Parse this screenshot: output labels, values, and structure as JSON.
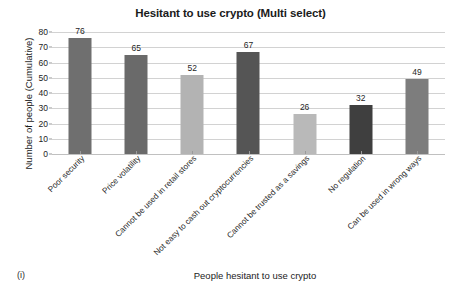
{
  "figure": {
    "marker": "(i)"
  },
  "chart_data": {
    "type": "bar",
    "title": "Hesitant to use crypto (Multi select)",
    "xlabel": "People hesitant to use crypto",
    "ylabel": "Number of people (Cumulative)",
    "ylim": [
      0,
      80
    ],
    "ytick_step": 10,
    "yticks": [
      "0",
      "10",
      "20",
      "30",
      "40",
      "50",
      "60",
      "70",
      "80"
    ],
    "grid": true,
    "legend": "none",
    "categories": [
      "Poor security",
      "Price volatility",
      "Cannot be used in retail stores",
      "Not easy to cash out cryptocurrencies",
      "Cannot be trusted as a savings",
      "No regulation",
      "Can be used in wrong ways"
    ],
    "values": [
      76,
      65,
      52,
      67,
      26,
      32,
      49
    ],
    "value_labels": [
      "76",
      "65",
      "52",
      "67",
      "26",
      "32",
      "49"
    ],
    "bar_colors": [
      "#6f6f6f",
      "#6a6a6a",
      "#b3b3b3",
      "#555555",
      "#b9b9b9",
      "#3f3f3f",
      "#7d7d7d"
    ],
    "grid_color": "#d2d2d2",
    "axis_color": "#9a9a9a"
  }
}
